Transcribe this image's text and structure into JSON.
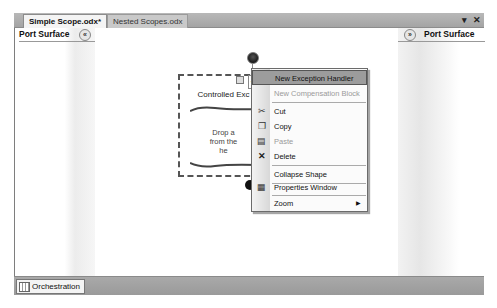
{
  "tabs": [
    {
      "label": "Simple Scope.odx*",
      "active": true
    },
    {
      "label": "Nested Scopes.odx",
      "active": false
    }
  ],
  "window_controls": {
    "dropdown": "▾",
    "close": "✕"
  },
  "port_surface_left": {
    "label": "Port Surface",
    "collapse_glyph": "«"
  },
  "port_surface_right": {
    "label": "Port Surface",
    "expand_glyph": "»"
  },
  "scope_shape": {
    "icon": "{}",
    "title": "Controlled Exc",
    "drop_text_line1": "Drop a",
    "drop_text_line2": "from the",
    "drop_text_line3": "he"
  },
  "context_menu": {
    "items": [
      {
        "label": "New Exception Handler",
        "underline": "N",
        "icon": "",
        "highlighted": true,
        "disabled": false
      },
      {
        "label": "New Compensation Block",
        "underline": "B",
        "icon": "",
        "highlighted": false,
        "disabled": true
      },
      {
        "label": "Cut",
        "underline": "t",
        "icon": "scissors-icon",
        "highlighted": false,
        "disabled": false
      },
      {
        "label": "Copy",
        "underline": "y",
        "icon": "copy-icon",
        "highlighted": false,
        "disabled": false
      },
      {
        "label": "Paste",
        "underline": "P",
        "icon": "paste-icon",
        "highlighted": false,
        "disabled": true
      },
      {
        "label": "Delete",
        "underline": "D",
        "icon": "delete-icon",
        "highlighted": false,
        "disabled": false
      },
      {
        "label": "Collapse Shape",
        "underline": "C",
        "icon": "",
        "highlighted": false,
        "disabled": false
      },
      {
        "label": "Properties Window",
        "underline": "W",
        "icon": "properties-icon",
        "highlighted": false,
        "disabled": false
      },
      {
        "label": "Zoom",
        "underline": "Z",
        "icon": "",
        "highlighted": false,
        "disabled": false,
        "submenu": true
      }
    ],
    "glyphs": {
      "scissors": "✂",
      "copy": "❐",
      "paste": "▤",
      "delete": "✕",
      "properties": "▦",
      "submenu_arrow": "▶"
    }
  },
  "bottom_tab": {
    "label": "Orchestration"
  }
}
